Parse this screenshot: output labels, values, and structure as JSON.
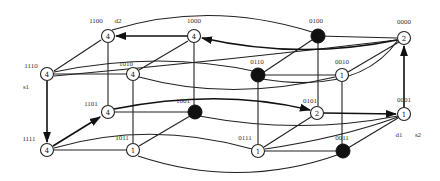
{
  "diagram": {
    "type": "4-dimensional hypercube state graph",
    "nodes": [
      {
        "id": "1100",
        "label": "1100",
        "value": "4",
        "filled": false,
        "x": 108,
        "y": 36
      },
      {
        "id": "1000",
        "label": "1000",
        "value": "4",
        "filled": false,
        "x": 194,
        "y": 36
      },
      {
        "id": "0100",
        "label": "0100",
        "value": "",
        "filled": true,
        "x": 318,
        "y": 36
      },
      {
        "id": "0000",
        "label": "0000",
        "value": "2",
        "filled": false,
        "x": 404,
        "y": 38
      },
      {
        "id": "1110",
        "label": "1110",
        "value": "4",
        "filled": false,
        "x": 47,
        "y": 74
      },
      {
        "id": "1010",
        "label": "1010",
        "value": "4",
        "filled": false,
        "x": 133,
        "y": 74
      },
      {
        "id": "0110",
        "label": "0110",
        "value": "",
        "filled": true,
        "x": 258,
        "y": 75
      },
      {
        "id": "0010",
        "label": "0010",
        "value": "1",
        "filled": false,
        "x": 342,
        "y": 75
      },
      {
        "id": "1101",
        "label": "1101",
        "value": "4",
        "filled": false,
        "x": 108,
        "y": 112
      },
      {
        "id": "1001",
        "label": "1001",
        "value": "",
        "filled": true,
        "x": 195,
        "y": 112
      },
      {
        "id": "0101",
        "label": "0101",
        "value": "2",
        "filled": false,
        "x": 317,
        "y": 113
      },
      {
        "id": "0001",
        "label": "0001",
        "value": "1",
        "filled": false,
        "x": 404,
        "y": 114
      },
      {
        "id": "1111",
        "label": "1111",
        "value": "4",
        "filled": false,
        "x": 47,
        "y": 150
      },
      {
        "id": "1011",
        "label": "1011",
        "value": "1",
        "filled": false,
        "x": 133,
        "y": 150
      },
      {
        "id": "0111",
        "label": "0111",
        "value": "1",
        "filled": false,
        "x": 258,
        "y": 151
      },
      {
        "id": "0011",
        "label": "0011",
        "value": "",
        "filled": true,
        "x": 343,
        "y": 151
      }
    ],
    "annotations": [
      {
        "text": "d2",
        "x": 118,
        "y": 22
      },
      {
        "text": "s1",
        "x": 26,
        "y": 88
      },
      {
        "text": "d1",
        "x": 399,
        "y": 136
      },
      {
        "text": "s2",
        "x": 420,
        "y": 136
      }
    ],
    "directed_edges": [
      {
        "from": "1000",
        "to": "1100"
      },
      {
        "from": "0000",
        "to": "1000"
      },
      {
        "from": "0001",
        "to": "0000"
      },
      {
        "from": "0101",
        "to": "0001"
      },
      {
        "from": "1101",
        "to": "0101"
      },
      {
        "from": "1111",
        "to": "1101"
      },
      {
        "from": "1110",
        "to": "1111"
      }
    ]
  }
}
